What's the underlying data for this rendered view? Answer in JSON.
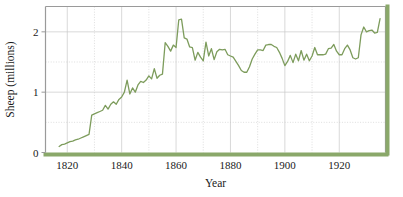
{
  "chart_data": {
    "type": "line",
    "title": "",
    "xlabel": "Year",
    "ylabel": "Sheep (millions)",
    "xlim": [
      1812,
      1937
    ],
    "ylim": [
      0,
      2.42
    ],
    "grid": true,
    "legend": false,
    "x_ticks": [
      1820,
      1840,
      1860,
      1880,
      1900,
      1920
    ],
    "x_tick_labels": [
      "1820",
      "1840",
      "1860",
      "1880",
      "1900",
      "1920"
    ],
    "y_ticks": [
      0,
      1,
      2
    ],
    "y_tick_labels": [
      "0",
      "1",
      "2"
    ],
    "y_minor_gridlines": [
      0.5,
      1.5
    ],
    "series": [
      {
        "name": "Sheep",
        "color": "#7d9c5c",
        "x": [
          1817,
          1818,
          1819,
          1820,
          1821,
          1822,
          1823,
          1824,
          1825,
          1826,
          1827,
          1828,
          1829,
          1830,
          1831,
          1832,
          1833,
          1834,
          1835,
          1836,
          1837,
          1838,
          1839,
          1840,
          1841,
          1842,
          1843,
          1844,
          1845,
          1846,
          1847,
          1848,
          1849,
          1850,
          1851,
          1852,
          1853,
          1854,
          1855,
          1856,
          1857,
          1858,
          1859,
          1860,
          1861,
          1862,
          1863,
          1864,
          1865,
          1866,
          1867,
          1868,
          1869,
          1870,
          1871,
          1872,
          1873,
          1874,
          1875,
          1876,
          1877,
          1878,
          1879,
          1880,
          1881,
          1882,
          1883,
          1884,
          1885,
          1886,
          1887,
          1888,
          1889,
          1890,
          1891,
          1892,
          1893,
          1894,
          1895,
          1896,
          1897,
          1898,
          1899,
          1900,
          1901,
          1902,
          1903,
          1904,
          1905,
          1906,
          1907,
          1908,
          1909,
          1910,
          1911,
          1912,
          1913,
          1914,
          1915,
          1916,
          1917,
          1918,
          1919,
          1920,
          1921,
          1922,
          1923,
          1924,
          1925,
          1926,
          1927,
          1928,
          1929,
          1930,
          1931,
          1932,
          1933,
          1934,
          1935
        ],
        "y": [
          0.1,
          0.13,
          0.14,
          0.16,
          0.18,
          0.19,
          0.21,
          0.22,
          0.24,
          0.26,
          0.28,
          0.3,
          0.62,
          0.64,
          0.66,
          0.68,
          0.7,
          0.78,
          0.72,
          0.8,
          0.84,
          0.8,
          0.88,
          0.92,
          1.0,
          1.2,
          0.97,
          1.07,
          1.0,
          1.12,
          1.18,
          1.16,
          1.2,
          1.27,
          1.22,
          1.39,
          1.23,
          1.28,
          1.3,
          1.82,
          1.76,
          1.68,
          1.78,
          1.74,
          2.2,
          2.21,
          1.9,
          1.88,
          1.75,
          1.74,
          1.53,
          1.66,
          1.58,
          1.52,
          1.83,
          1.6,
          1.72,
          1.54,
          1.67,
          1.71,
          1.7,
          1.71,
          1.62,
          1.6,
          1.58,
          1.51,
          1.44,
          1.36,
          1.33,
          1.33,
          1.42,
          1.55,
          1.63,
          1.7,
          1.7,
          1.69,
          1.78,
          1.79,
          1.79,
          1.76,
          1.74,
          1.66,
          1.56,
          1.44,
          1.51,
          1.61,
          1.49,
          1.63,
          1.52,
          1.69,
          1.53,
          1.63,
          1.52,
          1.6,
          1.74,
          1.62,
          1.62,
          1.62,
          1.63,
          1.72,
          1.73,
          1.79,
          1.68,
          1.62,
          1.62,
          1.72,
          1.78,
          1.7,
          1.57,
          1.55,
          1.57,
          1.95,
          2.08,
          2.0,
          2.02,
          2.03,
          1.98,
          1.99,
          2.22
        ]
      }
    ]
  },
  "axes": {
    "ylabel": "Sheep (millions)",
    "xlabel": "Year"
  },
  "style": {
    "line_color": "#7d9c5c",
    "axis_color": "#8aa86a",
    "frame_color": "#9a9a9a",
    "grid_color": "#c8c8c8",
    "background": "#ffffff"
  }
}
